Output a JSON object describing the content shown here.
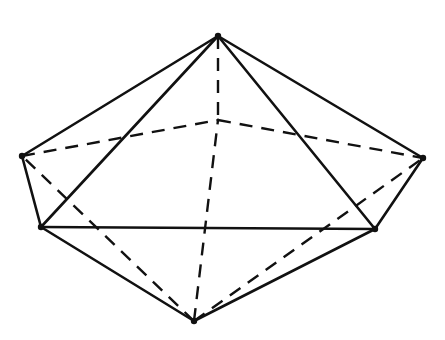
{
  "diagram": {
    "type": "pentagonal-bipyramid",
    "stroke_color": "#111111",
    "background": "#ffffff",
    "vertices": {
      "top": [
        218,
        36
      ],
      "bottom": [
        194,
        321
      ],
      "left": [
        22,
        156
      ],
      "front_left": [
        41,
        227
      ],
      "front_right": [
        375,
        229
      ],
      "right": [
        423,
        158
      ],
      "back": [
        218,
        120
      ]
    },
    "solid_edges": [
      [
        "top",
        "left"
      ],
      [
        "top",
        "front_left"
      ],
      [
        "top",
        "front_right"
      ],
      [
        "top",
        "right"
      ],
      [
        "left",
        "front_left"
      ],
      [
        "front_left",
        "front_right"
      ],
      [
        "front_right",
        "right"
      ],
      [
        "bottom",
        "front_left"
      ],
      [
        "bottom",
        "front_right"
      ]
    ],
    "dashed_edges": [
      [
        "top",
        "back"
      ],
      [
        "left",
        "back"
      ],
      [
        "back",
        "right"
      ],
      [
        "bottom",
        "back"
      ],
      [
        "bottom",
        "left"
      ],
      [
        "bottom",
        "right"
      ]
    ]
  }
}
